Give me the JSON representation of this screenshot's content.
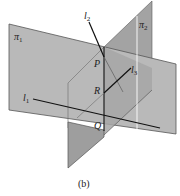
{
  "figure": {
    "caption": "(b)",
    "planes": [
      {
        "name": "π1",
        "label": "π",
        "subscript": "1"
      },
      {
        "name": "π2",
        "label": "π",
        "subscript": "2"
      }
    ],
    "lines": [
      {
        "name": "l1",
        "label": "l",
        "subscript": "1"
      },
      {
        "name": "l2",
        "label": "l",
        "subscript": "2"
      },
      {
        "name": "l3",
        "label": "l",
        "subscript": "3"
      }
    ],
    "points": [
      {
        "name": "P",
        "label": "P"
      },
      {
        "name": "R",
        "label": "R"
      },
      {
        "name": "Q",
        "label": "Q"
      }
    ],
    "colors": {
      "plane_fill": "#b4b4b4",
      "plane_dark": "#9c9c9c",
      "edge": "#555555",
      "line": "#111111",
      "background": "#ffffff"
    }
  }
}
